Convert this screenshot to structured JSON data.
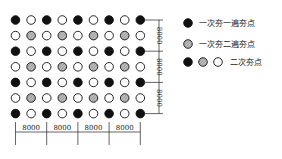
{
  "diagram": {
    "grid": {
      "rows": 7,
      "cols": 9,
      "pattern": [
        [
          "black",
          "white",
          "black",
          "white",
          "black",
          "white",
          "black",
          "white",
          "black"
        ],
        [
          "white",
          "hatched",
          "white",
          "hatched",
          "white",
          "hatched",
          "white",
          "hatched",
          "white"
        ],
        [
          "black",
          "white",
          "black",
          "white",
          "black",
          "white",
          "black",
          "white",
          "black"
        ],
        [
          "white",
          "hatched",
          "white",
          "hatched",
          "white",
          "hatched",
          "white",
          "hatched",
          "white"
        ],
        [
          "black",
          "white",
          "black",
          "white",
          "black",
          "white",
          "black",
          "white",
          "black"
        ],
        [
          "white",
          "hatched",
          "white",
          "hatched",
          "white",
          "hatched",
          "white",
          "hatched",
          "white"
        ],
        [
          "black",
          "white",
          "black",
          "white",
          "black",
          "white",
          "black",
          "white",
          "black"
        ]
      ]
    },
    "dimensions": {
      "horizontal": [
        "8000",
        "8000",
        "8000",
        "8000"
      ],
      "vertical": [
        "8000",
        "8000",
        "8000"
      ]
    },
    "legend": [
      {
        "symbols": [
          "black"
        ],
        "label": "一次夯一遍夯点"
      },
      {
        "symbols": [
          "hatched"
        ],
        "label": "一次夯二遍夯点"
      },
      {
        "symbols": [
          "black",
          "hatched",
          "white"
        ],
        "label": "二次夯点"
      }
    ],
    "colors": {
      "black": "#111111",
      "hatched": "#9a9a9a",
      "white": "#ffffff",
      "line": "#222222"
    }
  }
}
